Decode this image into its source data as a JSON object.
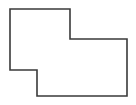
{
  "figure": {
    "name": "irregular-hexagon-outline",
    "canvas": {
      "width": 136,
      "height": 105,
      "background_color": "#ffffff"
    },
    "shape": {
      "type": "polygon",
      "sides": 6,
      "fill_color": "#ffffff",
      "stroke_color": "#3a3a3a",
      "stroke_width": 1.6,
      "vertices": [
        {
          "label": "top-left",
          "x": 10,
          "y": 9
        },
        {
          "label": "top-right-of-upper-block",
          "x": 70,
          "y": 9
        },
        {
          "label": "inner-step-upper",
          "x": 70,
          "y": 39
        },
        {
          "label": "far-top-right",
          "x": 127,
          "y": 39
        },
        {
          "label": "bottom-right",
          "x": 127,
          "y": 96
        },
        {
          "label": "bottom-left-of-lower-block",
          "x": 37,
          "y": 96
        },
        {
          "label": "inner-step-lower",
          "x": 37,
          "y": 70
        },
        {
          "label": "left-bottom",
          "x": 10,
          "y": 70
        }
      ],
      "path": "M 10 9 L 70 9 L 70 39 L 127 39 L 127 96 L 37 96 L 37 70 L 10 70 Z"
    },
    "edges": [
      {
        "name": "top-edge",
        "from": "top-left",
        "to": "top-right-of-upper-block",
        "orientation": "horizontal"
      },
      {
        "name": "upper-right-edge",
        "from": "top-right-of-upper-block",
        "to": "inner-step-upper",
        "orientation": "vertical"
      },
      {
        "name": "middle-top-edge",
        "from": "inner-step-upper",
        "to": "far-top-right",
        "orientation": "horizontal"
      },
      {
        "name": "right-edge",
        "from": "far-top-right",
        "to": "bottom-right",
        "orientation": "vertical"
      },
      {
        "name": "bottom-edge",
        "from": "bottom-right",
        "to": "bottom-left-of-lower-block",
        "orientation": "horizontal"
      },
      {
        "name": "lower-left-edge",
        "from": "bottom-left-of-lower-block",
        "to": "inner-step-lower",
        "orientation": "vertical"
      },
      {
        "name": "middle-bottom-edge",
        "from": "inner-step-lower",
        "to": "left-bottom",
        "orientation": "horizontal"
      },
      {
        "name": "left-edge",
        "from": "left-bottom",
        "to": "top-left",
        "orientation": "vertical"
      }
    ]
  }
}
